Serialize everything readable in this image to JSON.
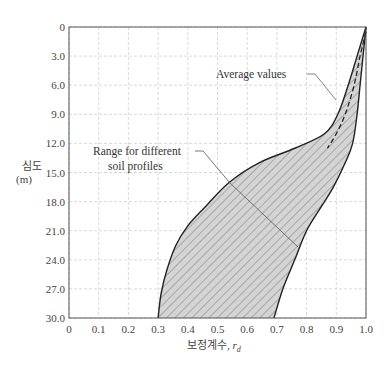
{
  "chart_data": {
    "type": "area",
    "title": "",
    "xlabel": "보정계수, r_d",
    "ylabel": "심도 (m)",
    "xlim": [
      0,
      1.0
    ],
    "ylim": [
      30.0,
      0
    ],
    "y_inverted": true,
    "grid": true,
    "x_ticks": [
      "0",
      "0.1",
      "0.2",
      "0.3",
      "0.4",
      "0.5",
      "0.6",
      "0.7",
      "0.8",
      "0.9",
      "1.0"
    ],
    "y_ticks": [
      "0",
      "3.0",
      "6.0",
      "9.0",
      "12.0",
      "15.0",
      "18.0",
      "21.0",
      "24.0",
      "27.0",
      "30.0"
    ],
    "series": [
      {
        "name": "Lower bound (range)",
        "style": "solid",
        "points": [
          [
            1.0,
            0
          ],
          [
            0.97,
            3
          ],
          [
            0.94,
            6
          ],
          [
            0.905,
            9
          ],
          [
            0.86,
            11
          ],
          [
            0.76,
            12.5
          ],
          [
            0.64,
            14
          ],
          [
            0.54,
            16
          ],
          [
            0.46,
            18.5
          ],
          [
            0.4,
            20.5
          ],
          [
            0.36,
            22.5
          ],
          [
            0.33,
            25
          ],
          [
            0.31,
            27.5
          ],
          [
            0.3,
            30
          ]
        ]
      },
      {
        "name": "Upper bound (range)",
        "style": "solid",
        "points": [
          [
            1.0,
            0
          ],
          [
            0.99,
            3
          ],
          [
            0.98,
            6
          ],
          [
            0.97,
            9
          ],
          [
            0.955,
            12
          ],
          [
            0.93,
            14
          ],
          [
            0.89,
            16.5
          ],
          [
            0.85,
            18.5
          ],
          [
            0.8,
            21
          ],
          [
            0.76,
            24
          ],
          [
            0.72,
            27
          ],
          [
            0.69,
            30
          ]
        ]
      },
      {
        "name": "Average values",
        "style": "dashed",
        "points": [
          [
            1.0,
            0.5
          ],
          [
            0.98,
            3
          ],
          [
            0.96,
            6
          ],
          [
            0.93,
            9
          ],
          [
            0.9,
            11
          ],
          [
            0.87,
            12.5
          ]
        ]
      }
    ],
    "annotations": [
      {
        "text": "Average values",
        "pointer_to": [
          0.91,
          9.5
        ]
      },
      {
        "text": "Range for different\nsoil profiles",
        "pointer_to": [
          0.78,
          21.5
        ]
      }
    ]
  },
  "labels": {
    "y_axis_line1": "심도",
    "y_axis_line2": "(m)",
    "x_axis_main": "보정계수, ",
    "x_axis_symbol": "r",
    "x_axis_sub": "d",
    "avg": "Average values",
    "range1": "Range for different",
    "range2": "soil profiles"
  }
}
